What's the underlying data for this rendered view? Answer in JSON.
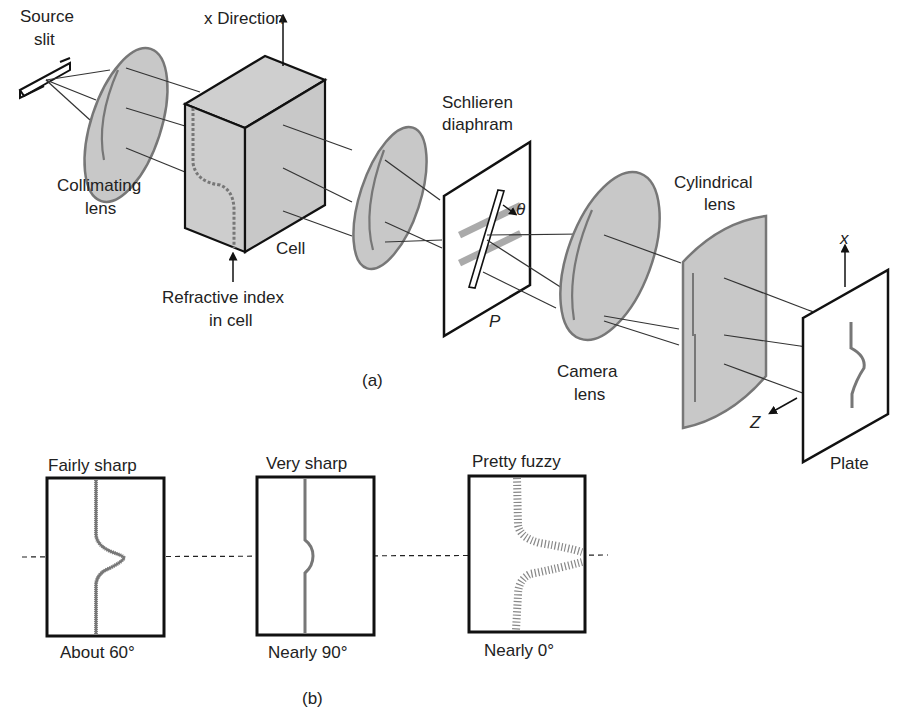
{
  "figure": {
    "part_a": {
      "caption": "(a)",
      "labels": {
        "source_slit_line1": "Source",
        "source_slit_line2": "slit",
        "x_direction": "x Direction",
        "collimating_lens_line1": "Collimating",
        "collimating_lens_line2": "lens",
        "cell": "Cell",
        "refractive_index_line1": "Refractive index",
        "refractive_index_line2": "in cell",
        "schlieren_line1": "Schlieren",
        "schlieren_line2": "diaphram",
        "theta": "θ",
        "p": "P",
        "camera_lens_line1": "Camera",
        "camera_lens_line2": "lens",
        "cylindrical_lens_line1": "Cylindrical",
        "cylindrical_lens_line2": "lens",
        "axis_x": "x",
        "axis_z": "Z",
        "plate": "Plate"
      }
    },
    "part_b": {
      "caption": "(b)",
      "panels": [
        {
          "title": "Fairly sharp",
          "angle": "About 60°",
          "style": "rough-gaussian"
        },
        {
          "title": "Very sharp",
          "angle": "Nearly 90°",
          "style": "sharp-line"
        },
        {
          "title": "Pretty fuzzy",
          "angle": "Nearly 0°",
          "style": "dotted-broad"
        }
      ]
    },
    "colors": {
      "lens_fill": "#c8c8c8",
      "line": "#111111",
      "trace": "#777777"
    }
  }
}
